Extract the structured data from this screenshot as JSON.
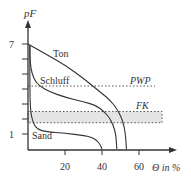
{
  "chart_data": {
    "type": "line",
    "title": "",
    "xlabel": "Θ in %",
    "ylabel": "pF",
    "xlim": [
      0,
      78
    ],
    "ylim": [
      0,
      8.4
    ],
    "x_ticks": [
      {
        "value": 20,
        "label": "20"
      },
      {
        "value": 40,
        "label": "40"
      },
      {
        "value": 60,
        "label": "60"
      }
    ],
    "y_ticks": [
      {
        "value": 1,
        "label": "1"
      },
      {
        "value": 2,
        "label": ""
      },
      {
        "value": 3,
        "label": ""
      },
      {
        "value": 4,
        "label": ""
      },
      {
        "value": 5,
        "label": ""
      },
      {
        "value": 6,
        "label": ""
      },
      {
        "value": 7,
        "label": "7"
      }
    ],
    "grid": false,
    "series": [
      {
        "name": "Ton",
        "points": [
          [
            0,
            7
          ],
          [
            10,
            6.3
          ],
          [
            20,
            5.6
          ],
          [
            30,
            4.7
          ],
          [
            35,
            4.2
          ],
          [
            40,
            3.7
          ],
          [
            44,
            3.3
          ],
          [
            48,
            2.7
          ],
          [
            50.5,
            2.1
          ],
          [
            52,
            1.5
          ],
          [
            52.8,
            0.8
          ],
          [
            53.2,
            0
          ]
        ]
      },
      {
        "name": "Schluff",
        "points": [
          [
            1,
            6.9
          ],
          [
            1,
            6.2
          ],
          [
            1.5,
            5.4
          ],
          [
            3,
            4.7
          ],
          [
            6,
            4.2
          ],
          [
            12,
            3.8
          ],
          [
            20,
            3.45
          ],
          [
            30,
            3.15
          ],
          [
            37,
            2.9
          ],
          [
            41,
            2.5
          ],
          [
            44,
            2.1
          ],
          [
            46,
            1.6
          ],
          [
            47.5,
            1
          ],
          [
            48,
            0
          ]
        ]
      },
      {
        "name": "Sand",
        "points": [
          [
            1,
            6.9
          ],
          [
            1,
            4
          ],
          [
            1.3,
            2.6
          ],
          [
            2.5,
            1.8
          ],
          [
            5,
            1.3
          ],
          [
            10,
            1.15
          ],
          [
            20,
            1.05
          ],
          [
            30,
            0.9
          ],
          [
            34,
            0.8
          ],
          [
            37,
            0.6
          ],
          [
            39,
            0.3
          ],
          [
            40,
            0
          ]
        ]
      }
    ],
    "reference_lines": [
      {
        "name": "PWP",
        "pF": 4.2,
        "style": "dotted"
      }
    ],
    "bands": [
      {
        "name": "FK",
        "pF_range": [
          1.75,
          2.5
        ],
        "style": "dotted-border-gray-fill"
      }
    ],
    "annotations": [
      {
        "text": "Ton",
        "series": "Ton"
      },
      {
        "text": "Schluff",
        "series": "Schluff"
      },
      {
        "text": "Sand",
        "series": "Sand"
      },
      {
        "text": "PWP",
        "ref": "PWP"
      },
      {
        "text": "FK",
        "ref": "FK"
      }
    ],
    "legend": "none",
    "colors": {
      "line": "#333333",
      "band_fill": "#e4e4e4",
      "dotted": "#555555"
    }
  }
}
